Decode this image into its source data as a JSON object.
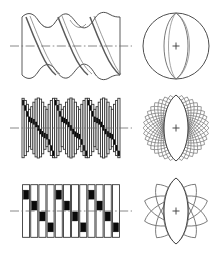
{
  "figure": {
    "background_color": "#ffffff",
    "line_color": "#3a3a3a",
    "fill_black": "#0a0a0a",
    "width": 216,
    "height": 257,
    "rows": [
      {
        "id": "row-continuous",
        "label": "Continuous helix",
        "side_view": {
          "name": "smooth-helix-side-view",
          "type": "sinusoidal-helix",
          "turns": 3,
          "pitch": 28,
          "amplitude": 30,
          "axis_y": 46,
          "x_start": 22,
          "x_end": 120,
          "style": "smooth-swept-band"
        },
        "end_view": {
          "name": "circle-end-view",
          "type": "circle-with-lens",
          "center_x": 176,
          "center_y": 46,
          "radius": 33,
          "lens_count": 2,
          "lens_half_width": 15
        }
      },
      {
        "id": "row-fine-strips",
        "label": "Fine discretization",
        "side_view": {
          "name": "fine-strip-helix-side-view",
          "type": "stepped-helix",
          "turns": 3,
          "strip_count": 45,
          "strip_width": 2.2,
          "axis_y": 128,
          "x_start": 22,
          "x_end": 120,
          "amplitude": 30,
          "black_block_height": 5
        },
        "end_view": {
          "name": "fine-rotated-lens-end-view",
          "type": "rotated-lens-stack",
          "center_x": 176,
          "center_y": 128,
          "radius": 33,
          "copy_count": 18,
          "lens_half_width": 16
        }
      },
      {
        "id": "row-coarse-strips",
        "label": "Coarse discretization",
        "side_view": {
          "name": "coarse-strip-helix-side-view",
          "type": "stepped-helix",
          "turns": 3,
          "strip_count": 12,
          "strip_width": 7,
          "axis_y": 211,
          "x_start": 22,
          "x_end": 120,
          "amplitude": 30,
          "black_block_height": 9
        },
        "end_view": {
          "name": "coarse-rotated-lens-end-view",
          "type": "rotated-lens-stack",
          "center_x": 176,
          "center_y": 211,
          "radius": 33,
          "copy_count": 5,
          "lens_half_width": 17
        }
      }
    ],
    "centerline": {
      "name": "axis-centerline",
      "style": "dash-dot",
      "color": "#6a6a6a"
    },
    "center_mark": {
      "name": "center-cross-mark",
      "glyph": "+",
      "size": 7
    }
  }
}
